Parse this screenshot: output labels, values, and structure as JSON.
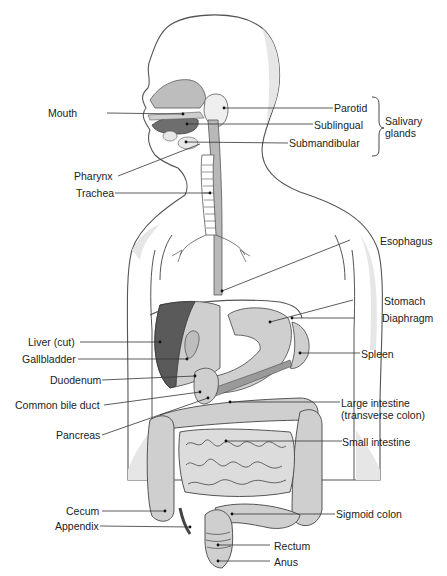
{
  "diagram": {
    "colors": {
      "outline": "#444444",
      "body_fill": "#ffffff",
      "shadow": "#e2e2e2",
      "organ_light": "#cfcfcf",
      "organ_mid": "#b5b5b5",
      "organ_dark": "#6e6e6e",
      "liver_cut": "#5a5a5a",
      "label_line": "#333333"
    },
    "labels_left": [
      {
        "id": "mouth",
        "text": "Mouth"
      },
      {
        "id": "pharynx",
        "text": "Pharynx"
      },
      {
        "id": "trachea",
        "text": "Trachea"
      },
      {
        "id": "liver",
        "text": "Liver (cut)"
      },
      {
        "id": "gallbladder",
        "text": "Gallbladder"
      },
      {
        "id": "duodenum",
        "text": "Duodenum"
      },
      {
        "id": "common_bile_duct",
        "text": "Common bile duct"
      },
      {
        "id": "pancreas",
        "text": "Pancreas"
      },
      {
        "id": "cecum",
        "text": "Cecum"
      },
      {
        "id": "appendix",
        "text": "Appendix"
      }
    ],
    "labels_right": [
      {
        "id": "parotid",
        "text": "Parotid"
      },
      {
        "id": "sublingual",
        "text": "Sublingual"
      },
      {
        "id": "submandibular",
        "text": "Submandibular"
      },
      {
        "id": "esophagus",
        "text": "Esophagus"
      },
      {
        "id": "stomach",
        "text": "Stomach"
      },
      {
        "id": "diaphragm",
        "text": "Diaphragm"
      },
      {
        "id": "spleen",
        "text": "Spleen"
      },
      {
        "id": "large_intestine",
        "text": "Large intestine"
      },
      {
        "id": "large_intestine_sub",
        "text": "(transverse colon)"
      },
      {
        "id": "small_intestine",
        "text": "Small intestine"
      },
      {
        "id": "sigmoid_colon",
        "text": "Sigmoid colon"
      },
      {
        "id": "rectum",
        "text": "Rectum"
      },
      {
        "id": "anus",
        "text": "Anus"
      }
    ],
    "group_label": {
      "line1": "Salivary",
      "line2": "glands"
    }
  }
}
